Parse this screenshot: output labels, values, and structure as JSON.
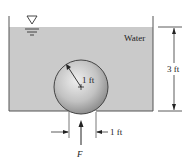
{
  "figure": {
    "fluid_label": "Water",
    "depth_label": "3 ft",
    "radius_label": "1 ft",
    "hole_label": "1 ft",
    "force_label": "F",
    "free_surface_symbol": "inverted-triangle-icon"
  },
  "colors": {
    "water": "#c9c9c9",
    "tank_wall": "#555555",
    "sphere_light": "#e6e6e6",
    "sphere_dark": "#8f8f8f",
    "line": "#333333",
    "text": "#222222"
  }
}
